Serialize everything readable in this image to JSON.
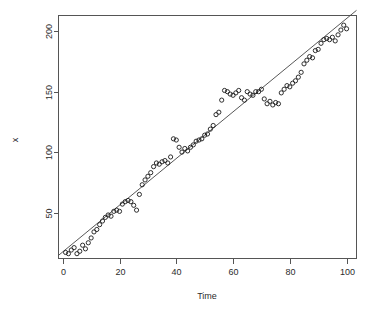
{
  "chart_data": {
    "type": "scatter",
    "title": "",
    "xlabel": "Time",
    "ylabel": "x",
    "xlim": [
      -1.5,
      103.5
    ],
    "ylim": [
      12,
      213
    ],
    "grid": false,
    "legend": "none",
    "point_symbol": "open-circle",
    "xticks": [
      0,
      20,
      40,
      60,
      80,
      100
    ],
    "yticks": [
      50,
      100,
      150,
      200
    ],
    "xtick_labels": [
      "0",
      "20",
      "40",
      "60",
      "80",
      "100"
    ],
    "ytick_labels": [
      "50",
      "100",
      "150",
      "200"
    ],
    "series": [
      {
        "name": "observations",
        "color": "#1a1a1a",
        "x": [
          1,
          2,
          3,
          4,
          5,
          6,
          7,
          8,
          9,
          10,
          11,
          12,
          13,
          14,
          15,
          16,
          17,
          18,
          19,
          20,
          21,
          22,
          23,
          24,
          25,
          26,
          27,
          28,
          29,
          30,
          31,
          32,
          33,
          34,
          35,
          36,
          37,
          38,
          39,
          40,
          41,
          42,
          43,
          44,
          45,
          46,
          47,
          48,
          49,
          50,
          51,
          52,
          53,
          54,
          55,
          56,
          57,
          58,
          59,
          60,
          61,
          62,
          63,
          64,
          65,
          66,
          67,
          68,
          69,
          70,
          71,
          72,
          73,
          74,
          75,
          76,
          77,
          78,
          79,
          80,
          81,
          82,
          83,
          84,
          85,
          86,
          87,
          88,
          89,
          90,
          91,
          92,
          93,
          94,
          95,
          96,
          97,
          98,
          99,
          100
        ],
        "y": [
          17,
          16,
          19,
          21,
          16,
          18,
          23,
          20,
          25,
          29,
          34,
          36,
          40,
          43,
          46,
          48,
          47,
          51,
          52,
          51,
          57,
          59,
          60,
          59,
          56,
          52,
          65,
          73,
          77,
          80,
          83,
          88,
          91,
          90,
          92,
          93,
          91,
          96,
          111,
          110,
          104,
          100,
          103,
          101,
          104,
          106,
          109,
          110,
          111,
          114,
          115,
          119,
          122,
          131,
          133,
          143,
          151,
          150,
          148,
          147,
          149,
          151,
          145,
          143,
          150,
          148,
          147,
          150,
          150,
          152,
          144,
          140,
          142,
          139,
          141,
          140,
          149,
          152,
          155,
          154,
          157,
          159,
          162,
          166,
          173,
          176,
          179,
          178,
          184,
          185,
          190,
          193,
          194,
          193,
          195,
          192,
          197,
          201,
          205,
          202
        ]
      }
    ],
    "fit_line": {
      "name": "trend",
      "color": "#444444",
      "intercept": 17.5,
      "slope": 1.93,
      "x_start": -1.5,
      "x_end": 103.5
    }
  }
}
